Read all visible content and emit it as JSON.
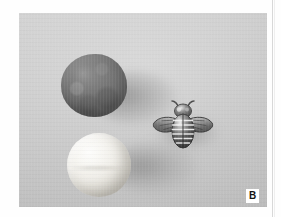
{
  "figure": {
    "panel_label": "B",
    "caption_text": "",
    "background_color": "#c9c9c9",
    "page_color": "#ffffff",
    "rule_color": "#d8d8d8"
  },
  "photo": {
    "alt_description": "Grayscale photograph on a flat gray background showing three objects: a dark rough sphere at upper left, a pale white sphere at lower left, and a small metallic bee ornament at center right.",
    "objects": [
      {
        "name": "dark-sphere",
        "label": "dark rough ball",
        "color": "#3f3f3f",
        "position": "upper-left",
        "shape": "sphere"
      },
      {
        "name": "light-sphere",
        "label": "white smooth ball",
        "color": "#f2f0ea",
        "position": "lower-left",
        "shape": "sphere"
      },
      {
        "name": "bee-ornament",
        "label": "metallic bee figurine",
        "color": "#2b2b2b",
        "position": "center-right",
        "shape": "insect"
      }
    ]
  }
}
